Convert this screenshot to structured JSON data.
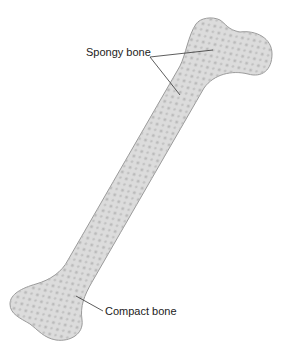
{
  "diagram": {
    "labels": {
      "spongy": "Spongy bone",
      "compact": "Compact bone"
    },
    "colors": {
      "bone_fill": "#dcdcdc",
      "bone_outline": "#9a9a9a",
      "pores": "#b9b9b9",
      "leader_line": "#333333",
      "text": "#222222"
    }
  }
}
